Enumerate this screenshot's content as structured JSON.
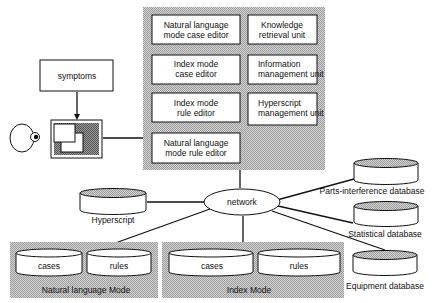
{
  "main_system": {
    "modules": [
      {
        "line1": "Natural language",
        "line2": "mode case editor"
      },
      {
        "line1": "Knowledge",
        "line2": "retrieval unit"
      },
      {
        "line1": "Index mode",
        "line2": "case editor"
      },
      {
        "line1": "Information",
        "line2": "management unit"
      },
      {
        "line1": "Index mode",
        "line2": "rule editor"
      },
      {
        "line1": "Hyperscript",
        "line2": "management unit"
      },
      {
        "line1": "Natural language",
        "line2": "mode rule editor"
      }
    ]
  },
  "symptoms": {
    "label": "symptoms"
  },
  "network": {
    "label": "network"
  },
  "hyperscript_db": {
    "label": "Hyperscript"
  },
  "databases": [
    {
      "label": "Parts-interference database"
    },
    {
      "label": "Statistical database"
    },
    {
      "label": "Equipment database"
    }
  ],
  "modes": [
    {
      "label": "Natural language Mode",
      "dbs": [
        {
          "label": "cases"
        },
        {
          "label": "rules"
        }
      ]
    },
    {
      "label": "Index Mode",
      "dbs": [
        {
          "label": "cases"
        },
        {
          "label": "rules"
        }
      ]
    }
  ],
  "colors": {
    "stroke": "#111111",
    "hatch": "#b8b8b8",
    "fill": "#ffffff"
  }
}
